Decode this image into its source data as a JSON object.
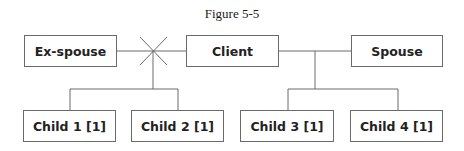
{
  "figure": {
    "title": "Figure 5-5"
  },
  "nodes": {
    "ex_spouse": "Ex-spouse",
    "client": "Client",
    "spouse": "Spouse",
    "child1": "Child 1 [1]",
    "child2": "Child 2 [1]",
    "child3": "Child 3 [1]",
    "child4": "Child 4 [1]"
  },
  "colors": {
    "line": "#6a6a6a",
    "text": "#222222"
  }
}
